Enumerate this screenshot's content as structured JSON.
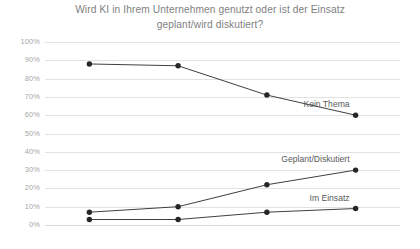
{
  "chart": {
    "title": "Wird KI in Ihrem Unternehmen genutzt oder ist der Einsatz geplant/wird diskutiert?"
  },
  "chart_data": {
    "type": "line",
    "title": "Wird KI in Ihrem Unternehmen genutzt oder ist der Einsatz geplant/wird diskutiert?",
    "xlabel": "",
    "ylabel": "",
    "categories": [
      "2018",
      "2019",
      "2020",
      "2021"
    ],
    "ylim": [
      0,
      100
    ],
    "ytick_labels": [
      "0%",
      "10%",
      "20%",
      "30%",
      "40%",
      "50%",
      "60%",
      "70%",
      "80%",
      "90%",
      "100%"
    ],
    "ytick_values": [
      0,
      10,
      20,
      30,
      40,
      50,
      60,
      70,
      80,
      90,
      100
    ],
    "grid": true,
    "legend_position": "inline-right-of-series",
    "series": [
      {
        "name": "Kein Thema",
        "values": [
          88,
          87,
          71,
          60
        ]
      },
      {
        "name": "Geplant/Diskutiert",
        "values": [
          7,
          10,
          22,
          30
        ]
      },
      {
        "name": "Im Einsatz",
        "values": [
          3,
          3,
          7,
          9
        ]
      }
    ],
    "annotations": [
      {
        "text": "Kein Thema",
        "series": "Kein Thema",
        "at_category": "2021"
      },
      {
        "text": "Geplant/Diskutiert",
        "series": "Geplant/Diskutiert",
        "at_category": "2021"
      },
      {
        "text": "Im Einsatz",
        "series": "Im Einsatz",
        "at_category": "2021"
      }
    ]
  }
}
